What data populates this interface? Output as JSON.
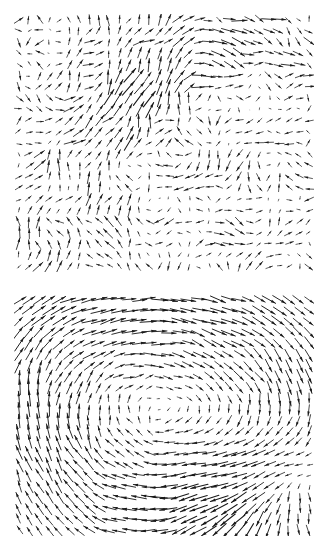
{
  "figure": {
    "width": 331,
    "height": 551,
    "background_color": "#ffffff",
    "arrow_color": "#1a1a1a",
    "layout": "two-panels-stacked-vertically",
    "panel_count": 2
  },
  "chart_data": [
    {
      "type": "scatter",
      "subtype": "quiver-vector-field",
      "title": "",
      "subtitle": "",
      "xlabel": "",
      "ylabel": "",
      "panel_index": 0,
      "panel_label": "top-panel",
      "grid": false,
      "axes_visible": false,
      "tick_labels_x": [],
      "tick_labels_y": [],
      "legend": [],
      "annotations": [],
      "xlim": [
        0,
        1
      ],
      "ylim": [
        0,
        1
      ],
      "plot_box_px": {
        "x": 14,
        "y": 14,
        "width": 300,
        "height": 258
      },
      "grid_nx": 30,
      "grid_ny": 23,
      "arrow_color": "#1a1a1a",
      "description": "Turbulent vector field with multiple small eddies, a strong down-left sweep in the lower-left quadrant and up-right flow along the right edge",
      "field_model": {
        "kind": "multi-vortex-turbulent",
        "base_scale": 0.85,
        "noise_amplitude": 0.3,
        "noise_seed": 20416,
        "vortices": [
          {
            "cx": 0.22,
            "cy": 0.3,
            "strength": -0.55,
            "radius": 0.22
          },
          {
            "cx": 0.58,
            "cy": 0.26,
            "strength": 0.62,
            "radius": 0.2
          },
          {
            "cx": 0.35,
            "cy": 0.66,
            "strength": 0.7,
            "radius": 0.26
          },
          {
            "cx": 0.72,
            "cy": 0.7,
            "strength": -0.5,
            "radius": 0.22
          },
          {
            "cx": 0.9,
            "cy": 0.45,
            "strength": 0.45,
            "radius": 0.28
          },
          {
            "cx": 0.08,
            "cy": 0.8,
            "strength": -0.4,
            "radius": 0.24
          },
          {
            "cx": 0.5,
            "cy": 0.48,
            "strength": 0.25,
            "radius": 0.15
          }
        ],
        "uniform": {
          "u": 0.1,
          "v": -0.05
        }
      }
    },
    {
      "type": "scatter",
      "subtype": "quiver-vector-field",
      "title": "",
      "subtitle": "",
      "xlabel": "",
      "ylabel": "",
      "panel_index": 1,
      "panel_label": "bottom-panel",
      "grid": false,
      "axes_visible": false,
      "tick_labels_x": [],
      "tick_labels_y": [],
      "legend": [],
      "annotations": [],
      "xlim": [
        0,
        1
      ],
      "ylim": [
        0,
        1
      ],
      "plot_box_px": {
        "x": 14,
        "y": 294,
        "width": 300,
        "height": 242
      },
      "grid_nx": 30,
      "grid_ny": 22,
      "arrow_color": "#1a1a1a",
      "description": "Dominant clockwise vortex centred left of middle, with a secondary outflow / saddle region in the lower-right corner and leftward flow along the upper-left edge",
      "field_model": {
        "kind": "single-dominant-vortex",
        "base_scale": 1.0,
        "noise_amplitude": 0.1,
        "noise_seed": 77311,
        "vortices": [
          {
            "cx": 0.54,
            "cy": 0.52,
            "strength": 1.35,
            "radius": 0.44
          },
          {
            "cx": 0.14,
            "cy": 0.24,
            "strength": 0.35,
            "radius": 0.26
          },
          {
            "cx": 0.88,
            "cy": 0.86,
            "strength": -0.55,
            "radius": 0.22
          }
        ],
        "sources": [
          {
            "cx": 0.84,
            "cy": 0.88,
            "strength": 0.55,
            "radius": 0.2
          }
        ],
        "uniform": {
          "u": 0.04,
          "v": 0.0
        }
      }
    }
  ]
}
